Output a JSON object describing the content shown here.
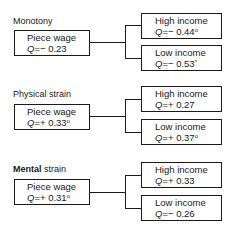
{
  "sections": [
    {
      "title": "Monotony",
      "source": {
        "label": "Piece wage",
        "q_prefix": "Q",
        "q_value": "=− 0.23",
        "marker": ""
      },
      "high": {
        "label": "High income",
        "q_prefix": "Q",
        "q_value": "=− 0.44",
        "marker": "o"
      },
      "low": {
        "label": "Low income",
        "q_prefix": "Q",
        "q_value": "=− 0.53",
        "marker": "*"
      }
    },
    {
      "title": "Physical strain",
      "source": {
        "label": "Piece wage",
        "q_prefix": "Q",
        "q_value": "=+ 0.33",
        "marker": "o"
      },
      "high": {
        "label": "High income",
        "q_prefix": "Q",
        "q_value": "=+ 0.27",
        "marker": ""
      },
      "low": {
        "label": "Low income",
        "q_prefix": "Q",
        "q_value": "=+ 0.37",
        "marker": "o"
      }
    },
    {
      "title_bold": "Mental",
      "title_rest": " strain",
      "source": {
        "label": "Piece wage",
        "q_prefix": "Q",
        "q_value": "=+ 0.31",
        "marker": "o"
      },
      "high": {
        "label": "High income",
        "q_prefix": "Q",
        "q_value": "=+ 0.33",
        "marker": ""
      },
      "low": {
        "label": "Low income",
        "q_prefix": "Q",
        "q_value": "=− 0.26",
        "marker": ""
      }
    }
  ]
}
